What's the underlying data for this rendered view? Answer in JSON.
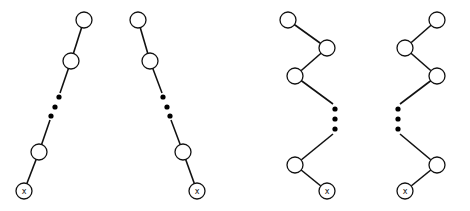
{
  "diagram": {
    "colors": {
      "stroke": "#111111",
      "fill": "#ffffff",
      "dot": "#000000"
    },
    "node_radius": 8,
    "end_label": "x",
    "trees": [
      {
        "id": "straight-left",
        "nodes": [
          [
            84,
            20
          ],
          [
            71,
            61
          ],
          [
            39,
            152
          ]
        ],
        "end_node": [
          24,
          191
        ],
        "dots": [
          [
            59,
            97
          ],
          [
            55,
            107
          ],
          [
            51,
            116
          ]
        ],
        "edges": [
          [
            [
              84,
              20
            ],
            [
              71,
              61
            ]
          ],
          [
            [
              71,
              61
            ],
            [
              60,
              93
            ]
          ],
          [
            [
              50,
              120
            ],
            [
              39,
              152
            ]
          ],
          [
            [
              39,
              152
            ],
            [
              24,
              191
            ]
          ]
        ]
      },
      {
        "id": "straight-right",
        "nodes": [
          [
            138,
            20
          ],
          [
            150,
            61
          ],
          [
            183,
            152
          ]
        ],
        "end_node": [
          197,
          191
        ],
        "dots": [
          [
            163,
            97
          ],
          [
            167,
            107
          ],
          [
            170,
            116
          ]
        ],
        "edges": [
          [
            [
              138,
              20
            ],
            [
              150,
              61
            ]
          ],
          [
            [
              150,
              61
            ],
            [
              162,
              93
            ]
          ],
          [
            [
              171,
              120
            ],
            [
              183,
              152
            ]
          ],
          [
            [
              183,
              152
            ],
            [
              197,
              191
            ]
          ]
        ]
      },
      {
        "id": "zigzag-left",
        "nodes": [
          [
            288,
            20
          ],
          [
            327,
            48
          ],
          [
            295,
            76
          ],
          [
            295,
            165
          ]
        ],
        "end_node": [
          327,
          191
        ],
        "dots": [
          [
            335,
            109
          ],
          [
            335,
            119
          ],
          [
            335,
            129
          ]
        ],
        "edges": [
          [
            [
              288,
              20
            ],
            [
              327,
              48
            ]
          ],
          [
            [
              327,
              48
            ],
            [
              295,
              76
            ]
          ],
          [
            [
              295,
              76
            ],
            [
              333,
              104
            ]
          ],
          [
            [
              333,
              134
            ],
            [
              295,
              165
            ]
          ],
          [
            [
              295,
              165
            ],
            [
              327,
              191
            ]
          ]
        ]
      },
      {
        "id": "zigzag-right",
        "nodes": [
          [
            437,
            20
          ],
          [
            405,
            48
          ],
          [
            437,
            76
          ],
          [
            437,
            165
          ]
        ],
        "end_node": [
          405,
          191
        ],
        "dots": [
          [
            398,
            109
          ],
          [
            398,
            119
          ],
          [
            398,
            129
          ]
        ],
        "edges": [
          [
            [
              437,
              20
            ],
            [
              405,
              48
            ]
          ],
          [
            [
              405,
              48
            ],
            [
              437,
              76
            ]
          ],
          [
            [
              437,
              76
            ],
            [
              400,
              104
            ]
          ],
          [
            [
              400,
              134
            ],
            [
              437,
              165
            ]
          ],
          [
            [
              437,
              165
            ],
            [
              405,
              191
            ]
          ]
        ]
      }
    ]
  }
}
